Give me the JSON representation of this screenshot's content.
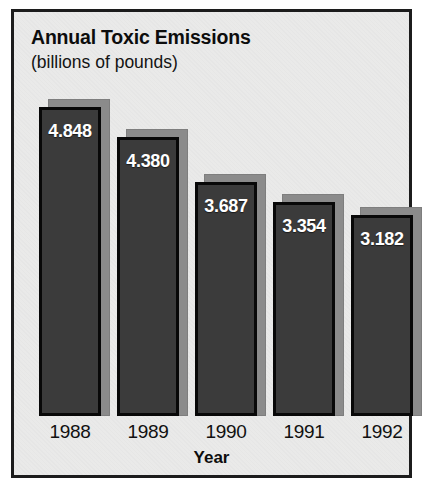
{
  "chart_data": {
    "type": "bar",
    "title": "Annual Toxic Emissions",
    "subtitle": "(billions of pounds)",
    "xlabel": "Year",
    "ylabel": "",
    "categories": [
      "1988",
      "1989",
      "1990",
      "1991",
      "1992"
    ],
    "values": [
      4.848,
      4.38,
      3.687,
      3.354,
      3.182
    ],
    "value_labels": [
      "4.848",
      "4.380",
      "3.687",
      "3.354",
      "3.182"
    ],
    "ylim": [
      0,
      5.2
    ],
    "grid": false,
    "legend": null,
    "units": "billions of pounds",
    "series": [
      {
        "name": "Annual Toxic Emissions",
        "values": [
          4.848,
          4.38,
          3.687,
          3.354,
          3.182
        ]
      }
    ],
    "style": {
      "bar_fill": "#3b3b3b",
      "bar_border": "#080808",
      "bar_shadow": "#8b8b8b",
      "value_label_color": "#ffffff",
      "background": "#e5e5e4",
      "frame_border": "#1c1c1c",
      "text_color": "#0d0d0d"
    }
  },
  "bars": [
    {
      "label": "1988",
      "value_label": "4.848",
      "left": 25,
      "width": 62,
      "top": 95
    },
    {
      "label": "1989",
      "value_label": "4.380",
      "left": 103,
      "width": 62,
      "top": 125
    },
    {
      "label": "1990",
      "value_label": "3.687",
      "left": 181,
      "width": 62,
      "top": 170
    },
    {
      "label": "1991",
      "value_label": "3.354",
      "left": 259,
      "width": 62,
      "top": 190
    },
    {
      "label": "1992",
      "value_label": "3.182",
      "left": 337,
      "width": 62,
      "top": 203
    }
  ]
}
